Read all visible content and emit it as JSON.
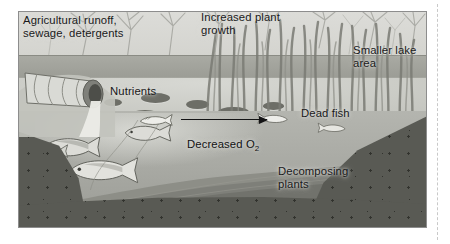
{
  "figure": {
    "type": "labeled-illustration",
    "frame": {
      "x": 18,
      "y": 11,
      "width": 407,
      "height": 215
    },
    "labels": [
      {
        "id": "agricultural-runoff",
        "text": "Agricultural runoff,\nsewage, detergents",
        "x": 22,
        "y": 13,
        "color": "#19191a",
        "align": "left"
      },
      {
        "id": "increased-plant-growth",
        "text": "Increased plant\ngrowth",
        "x": 200,
        "y": 9,
        "color": "#19191a",
        "align": "left"
      },
      {
        "id": "smaller-lake-area",
        "text": "Smaller lake\narea",
        "x": 352,
        "y": 42,
        "color": "#19191a",
        "align": "left"
      },
      {
        "id": "nutrients",
        "text": "Nutrients",
        "x": 109,
        "y": 83,
        "color": "#19191a",
        "align": "left"
      },
      {
        "id": "decreased-oxygen",
        "text": "Decreased O",
        "subscript": "2",
        "x": 186,
        "y": 123,
        "color": "#141415",
        "align": "left"
      },
      {
        "id": "dead-fish",
        "text": "Dead fish",
        "x": 300,
        "y": 105,
        "color": "#19191a",
        "align": "left"
      },
      {
        "id": "decomposing-plants",
        "text": "Decomposing\nplants",
        "x": 277,
        "y": 163,
        "color": "#19191a",
        "align": "left"
      }
    ],
    "arrow": {
      "id": "decreased-oxygen-arrow",
      "direction": "right",
      "x1": 180,
      "y1": 118,
      "x2": 266,
      "y2": 118,
      "color": "#141415"
    },
    "scene_elements": [
      {
        "id": "drainage-pipe",
        "label": "corrugated outflow pipe discharging into lake"
      },
      {
        "id": "lily-pads",
        "label": "floating lily pads on lake surface",
        "count": 6
      },
      {
        "id": "reed-bed",
        "label": "dense emergent reeds in shallow water"
      },
      {
        "id": "live-fish",
        "label": "live fish swimming in deeper water",
        "count": 4
      },
      {
        "id": "dead-fish",
        "label": "dead fish floating belly-up",
        "count": 3
      },
      {
        "id": "sediment-layers",
        "label": "decomposing plant sediment on lake bed"
      },
      {
        "id": "soil-banks",
        "label": "speckled soil cross-section"
      },
      {
        "id": "bare-trees",
        "label": "leafless trees along the far bank"
      }
    ],
    "palette": {
      "sky": "#dcdcd8",
      "far_bank": "#9b9c95",
      "lake_surface": "#c6c7c1",
      "water": "#a9aaa4",
      "soil": "#5a5b55",
      "lily_pad": "#6d6e67",
      "label_text": "#19191a",
      "frame_border": "#8d8d8d",
      "page_background": "#ffffff"
    }
  }
}
